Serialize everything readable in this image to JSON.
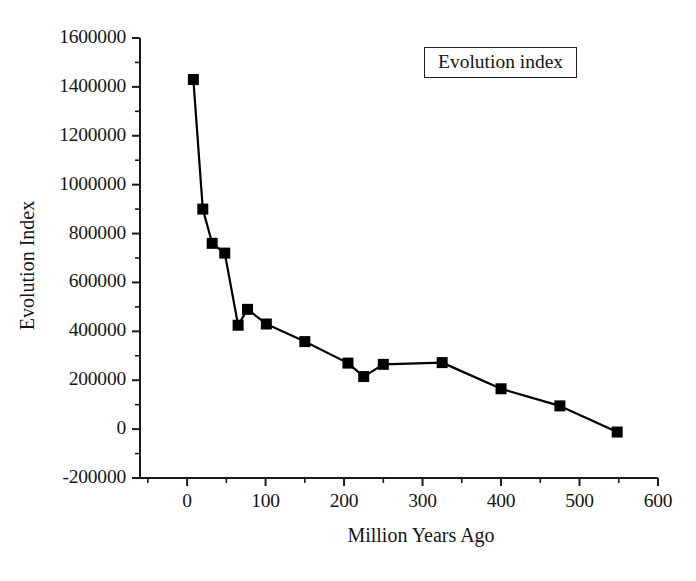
{
  "chart_data": {
    "type": "line",
    "title": "",
    "xlabel": "Million Years Ago",
    "ylabel": "Evolution Index",
    "xlim": [
      -60,
      600
    ],
    "ylim": [
      -200000,
      1600000
    ],
    "xticks": [
      0,
      100,
      200,
      300,
      400,
      500,
      600
    ],
    "xtick_labels": [
      "0",
      "100",
      "200",
      "300",
      "400",
      "500",
      "600"
    ],
    "yticks": [
      -200000,
      0,
      200000,
      400000,
      600000,
      800000,
      1000000,
      1200000,
      1400000,
      1600000
    ],
    "ytick_labels": [
      "-200000",
      "0",
      "200000",
      "400000",
      "600000",
      "800000",
      "1000000",
      "1200000",
      "1400000",
      "1600000"
    ],
    "minor_ticks": true,
    "grid": false,
    "legend": {
      "entries": [
        "Evolution index"
      ],
      "position": "upper-right-inside",
      "boxed": true
    },
    "series": [
      {
        "name": "Evolution index",
        "marker": "filled-square",
        "marker_color": "#000000",
        "line_color": "#000000",
        "x": [
          8,
          20,
          32,
          48,
          65,
          77,
          101,
          150,
          205,
          225,
          250,
          325,
          400,
          475,
          548
        ],
        "y": [
          1430000,
          900000,
          760000,
          720000,
          425000,
          490000,
          430000,
          358000,
          270000,
          215000,
          265000,
          272000,
          165000,
          95000,
          -12000
        ]
      }
    ]
  },
  "legend": {
    "label": "Evolution index"
  },
  "axes": {
    "x_title": "Million Years Ago",
    "y_title": "Evolution Index"
  },
  "colors": {
    "axis": "#1a1a1a",
    "series": "#000000",
    "background": "#ffffff"
  }
}
